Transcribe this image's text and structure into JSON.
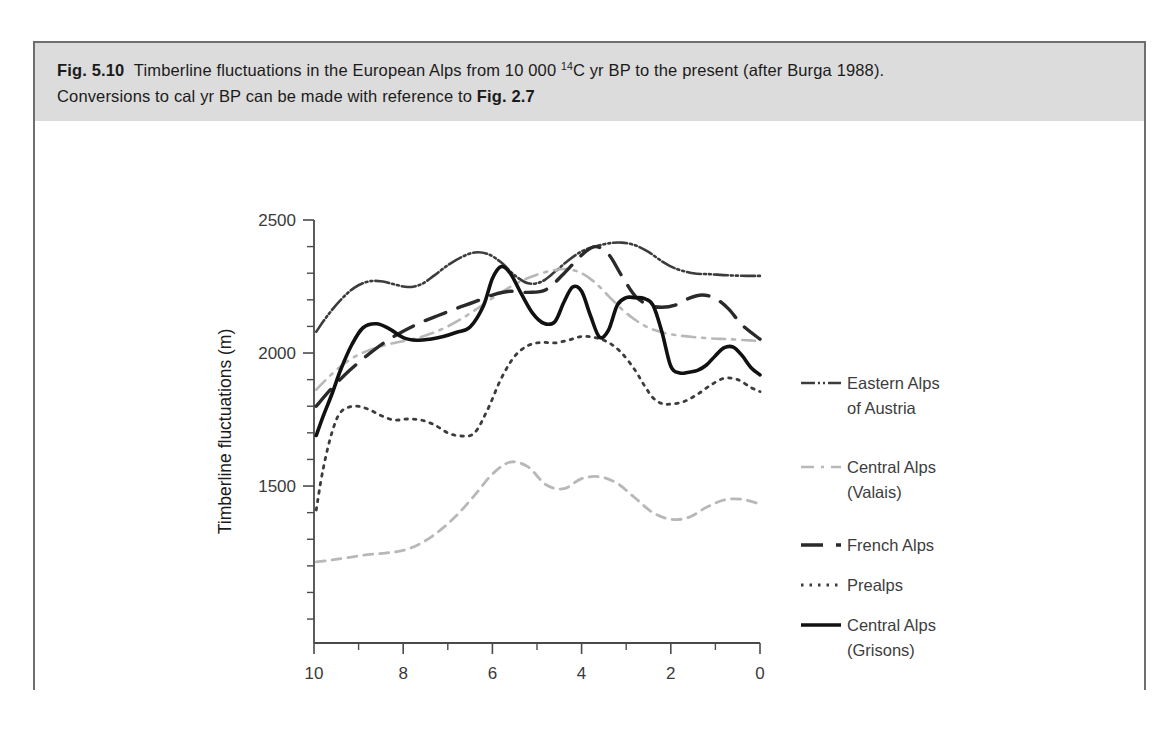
{
  "figure": {
    "number": "Fig. 5.10",
    "caption_line1_a": "Timberline fluctuations in the European Alps from 10 000 ",
    "caption_line1_sup": "14",
    "caption_line1_b": "C yr BP to the present (after Burga 1988).",
    "caption_line2_a": "Conversions to cal yr BP can be made with reference to ",
    "caption_line2_ref": "Fig. 2.7",
    "band_color": "#dcdcdc",
    "frame_color": "#6e6e6e"
  },
  "chart_data": {
    "type": "line",
    "title": "Timberline fluctuations in the European Alps",
    "xlabel": "Age (10³ years)",
    "ylabel": "Timberline fluctuations (m)",
    "xlim": [
      10,
      0
    ],
    "ylim": [
      910,
      2500
    ],
    "x_reversed": true,
    "grid": false,
    "legend_position": "right",
    "x_major_ticks": [
      10,
      8,
      6,
      4,
      2,
      0
    ],
    "x_major_tick_labels": [
      "10",
      "8",
      "6",
      "4",
      "2",
      "0"
    ],
    "x_minor_ticks": [
      9,
      7,
      5,
      3,
      1
    ],
    "y_major_ticks": [
      2500,
      2000,
      1500
    ],
    "y_major_tick_labels": [
      "2500",
      "2000",
      "1500"
    ],
    "y_minor_ticks": [
      2400,
      2300,
      2200,
      2100,
      1900,
      1800,
      1700,
      1600,
      1400,
      1300,
      1200,
      1100,
      1000
    ],
    "series": [
      {
        "name": "Eastern Alps of Austria",
        "color": "#3c3c3c",
        "width": 2.6,
        "dash": "14,3,2,3,2,3",
        "x": [
          9.95,
          9.7,
          9.4,
          9.1,
          8.8,
          8.5,
          8.2,
          7.9,
          7.6,
          7.3,
          7.0,
          6.7,
          6.4,
          6.1,
          5.8,
          5.5,
          5.2,
          4.9,
          4.6,
          4.3,
          4.0,
          3.7,
          3.4,
          3.1,
          2.8,
          2.5,
          2.2,
          1.9,
          1.5,
          1.1,
          0.7,
          0.3,
          0.0
        ],
        "y": [
          2080,
          2140,
          2200,
          2245,
          2268,
          2270,
          2258,
          2248,
          2258,
          2292,
          2330,
          2360,
          2378,
          2372,
          2340,
          2292,
          2262,
          2268,
          2305,
          2348,
          2382,
          2400,
          2412,
          2415,
          2405,
          2380,
          2345,
          2318,
          2300,
          2296,
          2292,
          2290,
          2290
        ]
      },
      {
        "name": "Central Alps (Valais)",
        "color": "#b8b8b8",
        "width": 2.6,
        "dash": "13,7,3,7",
        "x": [
          9.95,
          9.7,
          9.4,
          9.1,
          8.8,
          8.5,
          8.2,
          7.9,
          7.6,
          7.3,
          7.0,
          6.7,
          6.4,
          6.1,
          5.8,
          5.5,
          5.2,
          4.9,
          4.6,
          4.3,
          4.0,
          3.7,
          3.4,
          3.1,
          2.8,
          2.5,
          2.2,
          1.9,
          1.5,
          1.1,
          0.7,
          0.3,
          0.0
        ],
        "y": [
          1862,
          1905,
          1950,
          1985,
          2008,
          2025,
          2038,
          2048,
          2060,
          2078,
          2100,
          2128,
          2160,
          2195,
          2228,
          2258,
          2282,
          2300,
          2312,
          2315,
          2300,
          2265,
          2215,
          2165,
          2125,
          2095,
          2078,
          2068,
          2060,
          2055,
          2052,
          2048,
          2045
        ]
      },
      {
        "name": "French Alps",
        "color": "#2a2a2a",
        "width": 3.4,
        "dash": "22,13",
        "x": [
          9.95,
          9.6,
          9.2,
          8.8,
          8.4,
          8.0,
          7.6,
          7.2,
          6.8,
          6.4,
          6.0,
          5.6,
          5.2,
          4.8,
          4.4,
          4.0,
          3.7,
          3.4,
          3.1,
          2.8,
          2.5,
          2.2,
          1.9,
          1.6,
          1.3,
          1.0,
          0.7,
          0.4,
          0.0
        ],
        "y": [
          1800,
          1868,
          1935,
          1992,
          2042,
          2082,
          2115,
          2142,
          2168,
          2192,
          2218,
          2232,
          2228,
          2238,
          2298,
          2368,
          2400,
          2372,
          2290,
          2215,
          2180,
          2172,
          2180,
          2205,
          2218,
          2205,
          2165,
          2105,
          2052
        ]
      },
      {
        "name": "Prealps",
        "color": "#3c3c3c",
        "width": 2.8,
        "dash": "2.5,6",
        "x": [
          9.95,
          9.8,
          9.6,
          9.4,
          9.1,
          8.8,
          8.5,
          8.2,
          7.9,
          7.6,
          7.3,
          7.0,
          6.7,
          6.4,
          6.1,
          5.8,
          5.5,
          5.2,
          4.9,
          4.6,
          4.3,
          4.0,
          3.7,
          3.4,
          3.1,
          2.8,
          2.6,
          2.4,
          2.2,
          2.0,
          1.7,
          1.4,
          1.1,
          0.8,
          0.5,
          0.2,
          0.0
        ],
        "y": [
          1410,
          1560,
          1700,
          1778,
          1800,
          1790,
          1765,
          1748,
          1752,
          1748,
          1730,
          1700,
          1688,
          1700,
          1790,
          1905,
          1988,
          2028,
          2040,
          2038,
          2048,
          2062,
          2058,
          2040,
          2000,
          1935,
          1880,
          1832,
          1810,
          1808,
          1818,
          1845,
          1880,
          1905,
          1900,
          1870,
          1855
        ]
      },
      {
        "name": "Central Alps (Grisons)",
        "color": "#111111",
        "width": 3.6,
        "dash": "",
        "x": [
          9.95,
          9.8,
          9.6,
          9.4,
          9.15,
          8.9,
          8.6,
          8.3,
          8.0,
          7.7,
          7.4,
          7.1,
          6.8,
          6.5,
          6.2,
          6.0,
          5.8,
          5.6,
          5.35,
          5.1,
          4.85,
          4.6,
          4.4,
          4.2,
          4.0,
          3.8,
          3.6,
          3.4,
          3.2,
          3.0,
          2.8,
          2.6,
          2.4,
          2.2,
          2.0,
          1.8,
          1.6,
          1.4,
          1.2,
          1.0,
          0.8,
          0.6,
          0.4,
          0.2,
          0.0
        ],
        "y": [
          1690,
          1760,
          1845,
          1938,
          2032,
          2095,
          2110,
          2090,
          2058,
          2048,
          2052,
          2062,
          2078,
          2098,
          2178,
          2280,
          2325,
          2300,
          2222,
          2150,
          2112,
          2118,
          2190,
          2248,
          2232,
          2140,
          2060,
          2085,
          2180,
          2208,
          2208,
          2205,
          2180,
          2080,
          1950,
          1925,
          1928,
          1935,
          1955,
          1990,
          2020,
          2022,
          1990,
          1945,
          1918
        ]
      },
      {
        "name": "Jura",
        "color": "#b8b8b8",
        "width": 2.8,
        "dash": "9,7",
        "x": [
          9.95,
          9.6,
          9.2,
          8.8,
          8.4,
          8.0,
          7.6,
          7.2,
          6.8,
          6.4,
          6.0,
          5.6,
          5.2,
          4.8,
          4.4,
          4.0,
          3.6,
          3.2,
          2.8,
          2.4,
          2.0,
          1.6,
          1.2,
          0.8,
          0.4,
          0.0
        ],
        "y": [
          1215,
          1222,
          1232,
          1242,
          1248,
          1258,
          1285,
          1330,
          1390,
          1465,
          1545,
          1590,
          1572,
          1505,
          1490,
          1528,
          1535,
          1510,
          1455,
          1400,
          1375,
          1382,
          1420,
          1448,
          1450,
          1432
        ]
      }
    ]
  },
  "legend": {
    "items": [
      {
        "label_line1": "Eastern Alps",
        "label_line2": "of Austria"
      },
      {
        "label_line1": "Central Alps",
        "label_line2": "(Valais)"
      },
      {
        "label_line1": "French Alps",
        "label_line2": ""
      },
      {
        "label_line1": "Prealps",
        "label_line2": ""
      },
      {
        "label_line1": "Central Alps",
        "label_line2": "(Grisons)"
      },
      {
        "label_line1": "Jura",
        "label_line2": ""
      }
    ]
  },
  "axes": {
    "y_title": "Timberline fluctuations (m)",
    "x_title_a": "Age (10",
    "x_title_sup": "3",
    "x_title_b": " years)"
  }
}
